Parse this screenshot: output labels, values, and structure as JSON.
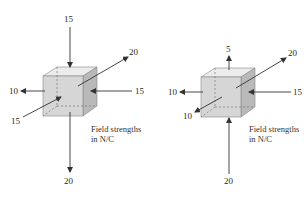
{
  "figures": [
    {
      "name": "cube-a",
      "labels": {
        "top": "15",
        "upper_right": "20",
        "left": "10",
        "right": "15",
        "lower_left": "15",
        "bottom": "20"
      },
      "note_line1": "Field strengths",
      "note_line2": "in N/C"
    },
    {
      "name": "cube-b",
      "labels": {
        "top": "5",
        "upper_right": "20",
        "left": "10",
        "right": "15",
        "lower_left": "10",
        "bottom": "20"
      },
      "note_line1": "Field strengths",
      "note_line2": "in N/C"
    }
  ],
  "colors": {
    "front_face": "#d6d6d6",
    "top_face": "#ececec",
    "side_face": "#b9b9b9",
    "arrow": "#333333"
  }
}
